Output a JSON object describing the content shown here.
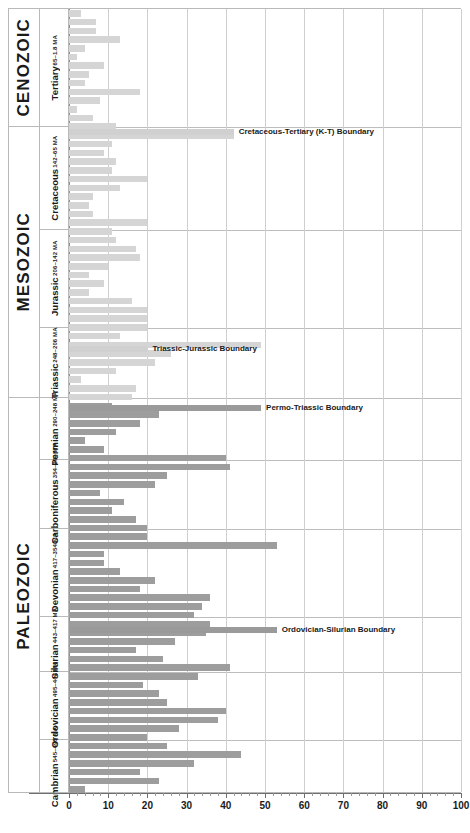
{
  "chart_data": {
    "type": "bar",
    "orientation": "horizontal",
    "title": "",
    "xlabel": "",
    "ylabel": "",
    "xlim": [
      0,
      100
    ],
    "xticks": [
      0,
      10,
      20,
      30,
      40,
      50,
      60,
      70,
      80,
      90,
      100
    ],
    "xtick_labels": [
      "0",
      "10",
      "20",
      "30",
      "40",
      "50",
      "60",
      "70",
      "80",
      "90",
      "100"
    ],
    "grid": "vertical",
    "legend": "none",
    "eras": [
      {
        "label": "CENOZOIC",
        "top_pct": 0.0,
        "height_pct": 15.0
      },
      {
        "label": "MESOZOIC",
        "top_pct": 15.0,
        "height_pct": 34.6
      },
      {
        "label": "PALEOZOIC",
        "top_pct": 49.6,
        "height_pct": 50.4
      }
    ],
    "periods": [
      {
        "name": "Tertiary",
        "age": "65–1.8 MA",
        "top_pct": 0.0,
        "height_pct": 15.0
      },
      {
        "name": "Cretaceous",
        "age": "142–65 MA",
        "top_pct": 15.0,
        "height_pct": 13.2
      },
      {
        "name": "Jurassic",
        "age": "206–142 MA",
        "top_pct": 28.2,
        "height_pct": 12.5
      },
      {
        "name": "Triassic",
        "age": "248–206 MA",
        "top_pct": 40.7,
        "height_pct": 8.9
      },
      {
        "name": "Permian",
        "age": "290–248 MA",
        "top_pct": 49.6,
        "height_pct": 7.8
      },
      {
        "name": "Carboniferous",
        "age": "354–290 MA",
        "top_pct": 57.4,
        "height_pct": 8.9
      },
      {
        "name": "Devonian",
        "age": "417–354 MA",
        "top_pct": 66.3,
        "height_pct": 11.2
      },
      {
        "name": "Silurian",
        "age": "443–417 MA",
        "top_pct": 77.5,
        "height_pct": 6.9
      },
      {
        "name": "Ordovician",
        "age": "495–443 MA",
        "top_pct": 84.4,
        "height_pct": 8.7
      },
      {
        "name": "Cambrian",
        "age": "545–495 MA",
        "top_pct": 93.1,
        "height_pct": 6.9
      }
    ],
    "values": [
      3,
      7,
      7,
      13,
      4,
      2,
      9,
      5,
      4,
      18,
      8,
      2,
      6,
      12,
      42,
      11,
      9,
      12,
      11,
      20,
      13,
      6,
      5,
      6,
      20,
      11,
      12,
      17,
      18,
      10,
      5,
      9,
      5,
      16,
      20,
      20,
      20,
      13,
      49,
      26,
      22,
      12,
      3,
      17,
      16,
      11,
      23,
      18,
      12,
      4,
      9,
      40,
      41,
      25,
      22,
      8,
      14,
      11,
      17,
      20,
      20,
      53,
      9,
      9,
      13,
      22,
      18,
      36,
      34,
      32,
      36,
      35,
      27,
      17,
      24,
      41,
      33,
      19,
      23,
      25,
      40,
      38,
      28,
      20,
      25,
      44,
      32,
      18,
      23,
      4
    ],
    "bars": [
      {
        "value": 3,
        "tone": "light"
      },
      {
        "value": 7,
        "tone": "light"
      },
      {
        "value": 7,
        "tone": "light"
      },
      {
        "value": 13,
        "tone": "light"
      },
      {
        "value": 4,
        "tone": "light"
      },
      {
        "value": 2,
        "tone": "light"
      },
      {
        "value": 9,
        "tone": "light"
      },
      {
        "value": 5,
        "tone": "light"
      },
      {
        "value": 4,
        "tone": "light"
      },
      {
        "value": 18,
        "tone": "light"
      },
      {
        "value": 8,
        "tone": "light"
      },
      {
        "value": 2,
        "tone": "light"
      },
      {
        "value": 6,
        "tone": "light"
      },
      {
        "value": 12,
        "tone": "light"
      }
    ],
    "events": [
      {
        "label": "Cretaceous-Tertiary (K-T) Boundary",
        "value": 42,
        "tone": "event-light",
        "y_px": 128
      },
      {
        "label": "Triassic-Jurassic Boundary",
        "value": 20,
        "tone": "event-light",
        "y_px": 345
      },
      {
        "label": "Permo-Triassic Boundary",
        "value": 49,
        "tone": "event-dark",
        "y_px": 404
      },
      {
        "label": "Ordovician-Silurian Boundary",
        "value": 53,
        "tone": "event-dark",
        "y_px": 626
      }
    ],
    "colors": {
      "bar_light": "#d5d5d5",
      "bar_dark": "#9d9d9d",
      "event_light": "#d0d0d0",
      "event_dark": "#9a9a9a",
      "grid": "#cfcfcf",
      "axis": "#6e6e6e",
      "text": "#1a1a1a"
    }
  }
}
